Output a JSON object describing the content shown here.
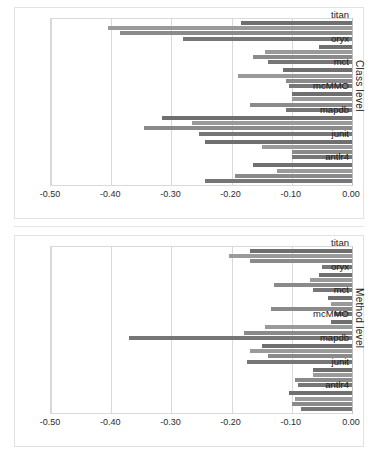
{
  "chart_data": [
    {
      "type": "bar",
      "orientation": "horizontal",
      "title": "",
      "ylabel": "Class level",
      "xlabel": "",
      "xlim": [
        -0.5,
        0.0
      ],
      "xticks": [
        "-0.50",
        "-0.40",
        "-0.30",
        "-0.20",
        "-0.10",
        "0.00"
      ],
      "xtick_values": [
        -0.5,
        -0.4,
        -0.3,
        -0.2,
        -0.1,
        0.0
      ],
      "grid": true,
      "legend": "none",
      "categories": [
        "titan",
        "oryx",
        "mct",
        "mcMMO",
        "mapdb",
        "junit",
        "antlr4"
      ],
      "series": [
        {
          "name": "series-1",
          "values": [
            -0.185,
            -0.055,
            -0.115,
            -0.1,
            -0.315,
            -0.245,
            -0.165
          ]
        },
        {
          "name": "series-2",
          "values": [
            -0.405,
            -0.145,
            -0.19,
            -0.1,
            -0.265,
            -0.15,
            -0.125
          ]
        },
        {
          "name": "series-3",
          "values": [
            -0.385,
            -0.165,
            -0.11,
            -0.17,
            -0.345,
            -0.1,
            -0.195
          ]
        },
        {
          "name": "series-4",
          "values": [
            -0.28,
            -0.14,
            -0.105,
            -0.11,
            -0.255,
            -0.1,
            -0.245
          ]
        }
      ]
    },
    {
      "type": "bar",
      "orientation": "horizontal",
      "title": "",
      "ylabel": "Method level",
      "xlabel": "",
      "xlim": [
        -0.5,
        0.0
      ],
      "xticks": [
        "-0.50",
        "-0.40",
        "-0.30",
        "-0.20",
        "-0.10",
        "0.00"
      ],
      "xtick_values": [
        -0.5,
        -0.4,
        -0.3,
        -0.2,
        -0.1,
        0.0
      ],
      "grid": true,
      "legend": "none",
      "categories": [
        "titan",
        "oryx",
        "mct",
        "mcMMO",
        "mapdb",
        "junit",
        "antlr4"
      ],
      "series": [
        {
          "name": "series-1",
          "values": [
            -0.17,
            -0.055,
            -0.04,
            -0.035,
            -0.15,
            -0.065,
            -0.105
          ]
        },
        {
          "name": "series-2",
          "values": [
            -0.205,
            -0.07,
            -0.035,
            -0.145,
            -0.17,
            -0.065,
            -0.095
          ]
        },
        {
          "name": "series-3",
          "values": [
            -0.17,
            -0.13,
            -0.135,
            -0.18,
            -0.14,
            -0.095,
            -0.1
          ]
        },
        {
          "name": "series-4",
          "values": [
            -0.05,
            -0.065,
            -0.03,
            -0.37,
            -0.175,
            -0.09,
            -0.085
          ]
        }
      ]
    }
  ],
  "charts": [
    {
      "id": "class",
      "axis_title": "Class level"
    },
    {
      "id": "method",
      "axis_title": "Method level"
    }
  ],
  "colors": {
    "series_1": "#6f6f6f",
    "series_2": "#9a9a9a",
    "series_3": "#8a8a8a",
    "series_4": "#767676",
    "grid": "#d9d9d9",
    "frame": "#e2e2e2",
    "text": "#1a1a1a"
  }
}
